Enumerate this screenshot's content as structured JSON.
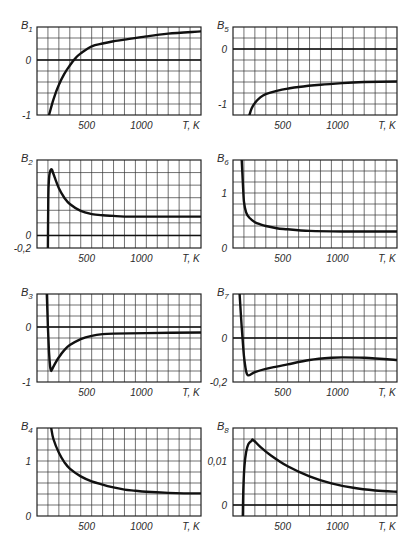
{
  "chart_data": [
    {
      "type": "line",
      "title": "B1",
      "id": "b1",
      "xlabel": "T, K",
      "ylabel": "B1",
      "xlim": [
        0,
        1500
      ],
      "ylim": [
        -1,
        0.6
      ],
      "grid": true,
      "xticks": [
        {
          "v": 500,
          "label": "500"
        },
        {
          "v": 1000,
          "label": "1000"
        }
      ],
      "yticks": [
        {
          "v": 0,
          "label": "0"
        },
        {
          "v": -1,
          "label": "-1"
        }
      ],
      "zero_line": 0,
      "row_step": 0.2,
      "x": [
        110,
        150,
        200,
        250,
        300,
        350,
        400,
        500,
        600,
        700,
        800,
        1000,
        1200,
        1500
      ],
      "y": [
        -1.0,
        -0.72,
        -0.45,
        -0.25,
        -0.1,
        0.03,
        0.12,
        0.25,
        0.3,
        0.34,
        0.37,
        0.43,
        0.48,
        0.52
      ]
    },
    {
      "type": "line",
      "title": "B5",
      "id": "b5",
      "xlabel": "T, K",
      "ylabel": "B5",
      "xlim": [
        0,
        1500
      ],
      "ylim": [
        -1.2,
        0.4
      ],
      "grid": true,
      "xticks": [
        {
          "v": 500,
          "label": "500"
        },
        {
          "v": 1000,
          "label": "1000"
        }
      ],
      "yticks": [
        {
          "v": 0,
          "label": "0"
        },
        {
          "v": -1,
          "label": "-1"
        }
      ],
      "zero_line": 0,
      "row_step": 0.2,
      "x": [
        150,
        170,
        200,
        250,
        300,
        400,
        500,
        600,
        800,
        1000,
        1200,
        1500
      ],
      "y": [
        -1.2,
        -1.08,
        -0.98,
        -0.88,
        -0.82,
        -0.76,
        -0.72,
        -0.69,
        -0.65,
        -0.62,
        -0.6,
        -0.59
      ]
    },
    {
      "type": "line",
      "title": "B2",
      "id": "b2",
      "xlabel": "T, K",
      "ylabel": "B2",
      "xlim": [
        0,
        1500
      ],
      "ylim": [
        -0.2,
        1.2
      ],
      "grid": true,
      "xticks": [
        {
          "v": 500,
          "label": "500"
        },
        {
          "v": 1000,
          "label": "1000"
        }
      ],
      "yticks": [
        {
          "v": 0,
          "label": "0"
        },
        {
          "v": -0.2,
          "label": "-0,2"
        }
      ],
      "zero_line": 0,
      "row_step": 0.2,
      "x": [
        100,
        103,
        110,
        120,
        135,
        150,
        200,
        250,
        300,
        400,
        500,
        600,
        700,
        800,
        1000,
        1500
      ],
      "y": [
        -0.2,
        0.6,
        0.9,
        1.02,
        1.05,
        0.98,
        0.75,
        0.6,
        0.5,
        0.39,
        0.34,
        0.32,
        0.31,
        0.3,
        0.3,
        0.3
      ]
    },
    {
      "type": "line",
      "title": "B6",
      "id": "b6",
      "xlabel": "T, K",
      "ylabel": "B6",
      "xlim": [
        0,
        1500
      ],
      "ylim": [
        0,
        1.6
      ],
      "grid": true,
      "xticks": [
        {
          "v": 500,
          "label": "500"
        },
        {
          "v": 1000,
          "label": "1000"
        }
      ],
      "yticks": [
        {
          "v": 0,
          "label": "0"
        },
        {
          "v": 1,
          "label": "1"
        }
      ],
      "zero_line": null,
      "row_step": 0.2,
      "x": [
        80,
        90,
        100,
        120,
        150,
        200,
        250,
        300,
        400,
        500,
        700,
        1000,
        1500
      ],
      "y": [
        1.6,
        1.2,
        0.85,
        0.65,
        0.55,
        0.47,
        0.43,
        0.4,
        0.36,
        0.34,
        0.31,
        0.3,
        0.3
      ]
    },
    {
      "type": "line",
      "title": "B3",
      "id": "b3",
      "xlabel": "T, K",
      "ylabel": "B3",
      "xlim": [
        0,
        1500
      ],
      "ylim": [
        -1,
        0.6
      ],
      "grid": true,
      "xticks": [
        {
          "v": 500,
          "label": "500"
        },
        {
          "v": 1000,
          "label": "1000"
        }
      ],
      "yticks": [
        {
          "v": 0,
          "label": "0"
        },
        {
          "v": -1,
          "label": "-1"
        }
      ],
      "zero_line": 0,
      "row_step": 0.2,
      "x": [
        90,
        100,
        110,
        120,
        130,
        150,
        200,
        250,
        300,
        400,
        500,
        600,
        700,
        1000,
        1500
      ],
      "y": [
        0.6,
        0.0,
        -0.45,
        -0.72,
        -0.8,
        -0.72,
        -0.55,
        -0.42,
        -0.33,
        -0.22,
        -0.16,
        -0.13,
        -0.12,
        -0.11,
        -0.1
      ]
    },
    {
      "type": "line",
      "title": "B7",
      "id": "b7",
      "xlabel": "T, K",
      "ylabel": "B7",
      "xlim": [
        0,
        1500
      ],
      "ylim": [
        -0.2,
        0.2
      ],
      "grid": true,
      "xticks": [
        {
          "v": 500,
          "label": "500"
        },
        {
          "v": 1000,
          "label": "1000"
        }
      ],
      "yticks": [
        {
          "v": 0,
          "label": "0"
        },
        {
          "v": -0.2,
          "label": "-0,2"
        }
      ],
      "zero_line": 0,
      "row_step": 0.05,
      "x": [
        60,
        80,
        100,
        120,
        140,
        200,
        300,
        400,
        500,
        700,
        900,
        1000,
        1200,
        1500
      ],
      "y": [
        0.2,
        0.05,
        -0.08,
        -0.15,
        -0.17,
        -0.155,
        -0.14,
        -0.13,
        -0.12,
        -0.1,
        -0.09,
        -0.088,
        -0.09,
        -0.1
      ]
    },
    {
      "type": "line",
      "title": "B4",
      "id": "b4",
      "xlabel": "T, K",
      "ylabel": "B4",
      "xlim": [
        0,
        1500
      ],
      "ylim": [
        0,
        1.6
      ],
      "grid": true,
      "xticks": [
        {
          "v": 500,
          "label": "500"
        },
        {
          "v": 1000,
          "label": "1000"
        }
      ],
      "yticks": [
        {
          "v": 0,
          "label": "0"
        },
        {
          "v": 1,
          "label": "1"
        }
      ],
      "zero_line": null,
      "row_step": 0.2,
      "x": [
        130,
        150,
        200,
        250,
        300,
        400,
        500,
        600,
        700,
        800,
        900,
        1000,
        1200,
        1500
      ],
      "y": [
        1.6,
        1.4,
        1.15,
        0.98,
        0.86,
        0.72,
        0.63,
        0.57,
        0.52,
        0.48,
        0.46,
        0.44,
        0.42,
        0.41
      ]
    },
    {
      "type": "line",
      "title": "B8",
      "id": "b8",
      "xlabel": "T, K",
      "ylabel": "B8",
      "xlim": [
        0,
        1500
      ],
      "ylim": [
        -0.0025,
        0.0175
      ],
      "grid": true,
      "xticks": [
        {
          "v": 500,
          "label": "500"
        },
        {
          "v": 1000,
          "label": "1000"
        }
      ],
      "yticks": [
        {
          "v": 0,
          "label": "0"
        },
        {
          "v": 0.01,
          "label": "0,01"
        }
      ],
      "zero_line": 0,
      "row_step": 0.0025,
      "x": [
        90,
        95,
        105,
        120,
        140,
        170,
        185,
        250,
        350,
        500,
        700,
        900,
        1100,
        1300,
        1500
      ],
      "y": [
        -0.0025,
        0.004,
        0.009,
        0.012,
        0.0138,
        0.0146,
        0.0148,
        0.0132,
        0.0112,
        0.0088,
        0.0065,
        0.0049,
        0.0039,
        0.0033,
        0.003
      ]
    }
  ],
  "panels": {
    "b1": {
      "title": "B1",
      "x_unit": "T, K"
    },
    "b5": {
      "title": "B5",
      "x_unit": "T, K"
    },
    "b2": {
      "title": "B2",
      "x_unit": "T, K"
    },
    "b6": {
      "title": "B6",
      "x_unit": "T, K"
    },
    "b3": {
      "title": "B3",
      "x_unit": "T, K"
    },
    "b7": {
      "title": "B7",
      "x_unit": "T, K"
    },
    "b4": {
      "title": "B4",
      "x_unit": "T, K"
    },
    "b8": {
      "title": "B8",
      "x_unit": "T, K"
    }
  }
}
